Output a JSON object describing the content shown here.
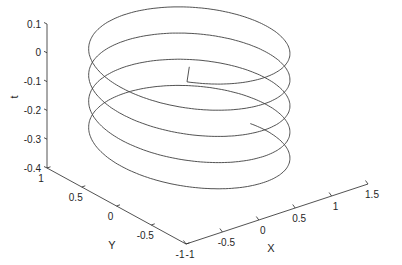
{
  "chart_data": {
    "type": "line",
    "subtype": "3d-helix",
    "title": "",
    "xlabel": "X",
    "ylabel": "Y",
    "zlabel": "t",
    "xlim": [
      -1,
      1.5
    ],
    "ylim": [
      -1,
      1
    ],
    "zlim": [
      -0.4,
      0.1
    ],
    "x_ticks": [
      "-1",
      "-0.5",
      "0",
      "0.5",
      "1",
      "1.5"
    ],
    "y_ticks": [
      "-1",
      "-0.5",
      "0",
      "0.5",
      "1"
    ],
    "z_ticks": [
      "-0.4",
      "-0.3",
      "-0.2",
      "-0.1",
      "0",
      "0.1"
    ],
    "grid": false,
    "series": [
      {
        "name": "helix",
        "description": "X = cos(theta), Y = sin(theta), t decreasing linearly",
        "radius": 1,
        "t_start": 0.1,
        "t_end": -0.3,
        "turns": 4.4,
        "start_angle_deg": 225,
        "lead_in_from": [
          0,
          0,
          0
        ],
        "color": "#404040"
      }
    ]
  },
  "colors": {
    "axis": "#262626",
    "line": "#404040",
    "background": "#ffffff"
  }
}
